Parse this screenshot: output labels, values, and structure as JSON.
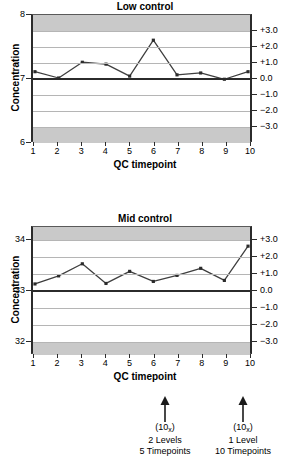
{
  "chart_data": [
    {
      "type": "line",
      "title": "Low control",
      "xlabel": "QC timepoint",
      "ylabel": "Concentration",
      "x": [
        1,
        2,
        3,
        4,
        5,
        6,
        7,
        8,
        9,
        10
      ],
      "values": [
        7.1,
        7.0,
        7.25,
        7.22,
        7.03,
        7.6,
        7.05,
        7.08,
        6.98,
        7.1
      ],
      "categories": [
        "1",
        "2",
        "3",
        "4",
        "5",
        "6",
        "7",
        "8",
        "9",
        "10"
      ],
      "ylim": [
        6,
        8
      ],
      "left_ticks": [
        "8",
        "7",
        "6"
      ],
      "left_tick_values": [
        8,
        7,
        6
      ],
      "right_axis_label": "SD",
      "right_ticks": [
        "+3.0",
        "+2.0",
        "+1.0",
        "0.0",
        "−1.0",
        "−2.0",
        "−3.0"
      ],
      "right_tick_values": [
        3,
        2,
        1,
        0,
        -1,
        -2,
        -3
      ],
      "mean": 7.0,
      "sd": 0.25,
      "grid": true,
      "legend": "none",
      "shaded_bands": [
        "beyond +3.0 SD",
        "beyond -3.0 SD"
      ]
    },
    {
      "type": "line",
      "title": "Mid control",
      "xlabel": "QC timepoint",
      "ylabel": "Concentration",
      "x": [
        1,
        2,
        3,
        4,
        5,
        6,
        7,
        8,
        9,
        10
      ],
      "values": [
        33.12,
        33.28,
        33.52,
        33.13,
        33.37,
        33.17,
        33.29,
        33.43,
        33.19,
        33.87
      ],
      "categories": [
        "1",
        "2",
        "3",
        "4",
        "5",
        "6",
        "7",
        "8",
        "9",
        "10"
      ],
      "ylim": [
        31.75,
        34.25
      ],
      "left_ticks": [
        "34",
        "33",
        "32"
      ],
      "left_tick_values": [
        34,
        33,
        32
      ],
      "right_axis_label": "SD",
      "right_ticks": [
        "+3.0",
        "+2.0",
        "+1.0",
        "0.0",
        "−1.0",
        "−2.0",
        "−3.0"
      ],
      "right_tick_values": [
        3,
        2,
        1,
        0,
        -1,
        -2,
        -3
      ],
      "mean": 33.0,
      "sd": 0.33,
      "grid": true,
      "legend": "none",
      "shaded_bands": [
        "beyond +3.0 SD",
        "beyond -3.0 SD"
      ]
    }
  ],
  "annotations": [
    {
      "symbol": "(10",
      "subscript": "x",
      "symbol_close": ")",
      "line2": "2 Levels",
      "line3": "5 Timepoints",
      "arrow": "up-arrow"
    },
    {
      "symbol": "(10",
      "subscript": "x",
      "symbol_close": ")",
      "line2": "1 Level",
      "line3": "10 Timepoints",
      "arrow": "up-arrow"
    }
  ],
  "colors": {
    "line": "#3f3f3f",
    "marker": "#2b2b2b",
    "band": "#c9c9c9",
    "grid": "#b5b5b5",
    "axis": "#2b2b2b",
    "background": "#ffffff"
  }
}
